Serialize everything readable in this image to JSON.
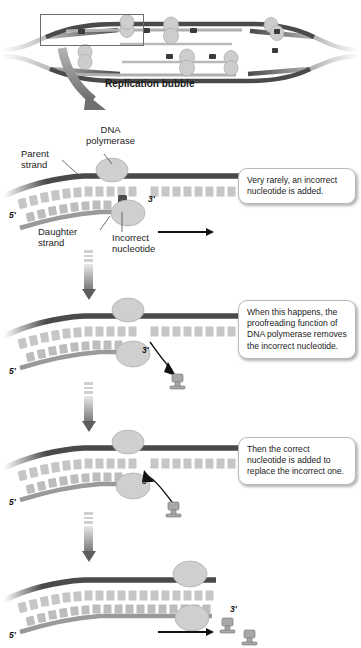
{
  "figure": {
    "title_clipped": "DNA polymerase",
    "bubble_label": "Replication bubble"
  },
  "labels": {
    "dna_polymerase": "DNA\npolymerase",
    "parent_strand": "Parent\nstrand",
    "daughter_strand": "Daughter\nstrand",
    "incorrect_nucleotide": "Incorrect\nnucleotide",
    "five_prime": "5'",
    "three_prime": "3'"
  },
  "callouts": [
    {
      "id": "callout-1",
      "text": "Very rarely, an incorrect nucleotide is added."
    },
    {
      "id": "callout-2",
      "text": "When this happens, the proofreading function of DNA polymerase removes the incorrect nucleotide."
    },
    {
      "id": "callout-3",
      "text": "Then the correct nucleotide is added to replace the incorrect one."
    }
  ],
  "panels": [
    {
      "id": "panel-1",
      "five_prime": "5'",
      "three_prime": "3'"
    },
    {
      "id": "panel-2",
      "five_prime": "5'",
      "three_prime": "3'"
    },
    {
      "id": "panel-3",
      "five_prime": "5'",
      "three_prime": "3'"
    },
    {
      "id": "panel-4",
      "five_prime": "5'",
      "three_prime": "3'"
    }
  ],
  "colors": {
    "parent_strand": "#4a4a4a",
    "daughter_strand": "#9a9a9a",
    "nucleotide_block": "#c6c6c6",
    "incorrect_nucleotide": "#4d4d4d",
    "polymerase": "#cfcfcf",
    "background": "#ffffff",
    "callout_border": "#b9b9b9",
    "text": "#1b1b1b"
  }
}
